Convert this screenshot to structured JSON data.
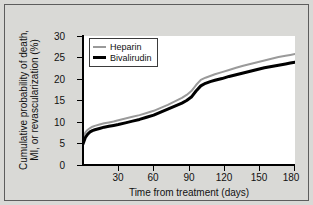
{
  "chart_data": {
    "type": "line",
    "title": "",
    "xlabel": "Time from treatment (days)",
    "ylabel": "Cumulative probability of death, MI, or revascularization (%)",
    "ylabel_line1": "Cumulative probability of death,",
    "ylabel_line2": "MI, or revascularization (%)",
    "xlim": [
      0,
      180
    ],
    "ylim": [
      0,
      30
    ],
    "xticks": [
      30,
      60,
      90,
      120,
      150,
      180
    ],
    "yticks": [
      0,
      5,
      10,
      15,
      20,
      25,
      30
    ],
    "xtick_labels": [
      "30",
      "60",
      "90",
      "120",
      "150",
      "180"
    ],
    "ytick_labels": [
      "0",
      "5",
      "10",
      "15",
      "20",
      "25",
      "30"
    ],
    "grid": false,
    "legend_position": "upper-left-inside",
    "series": [
      {
        "name": "Heparin",
        "color": "#9a9a9a",
        "line_width": 2,
        "x": [
          0,
          2,
          4,
          6,
          8,
          10,
          14,
          18,
          22,
          26,
          30,
          36,
          42,
          48,
          54,
          60,
          66,
          72,
          78,
          84,
          88,
          92,
          96,
          100,
          104,
          108,
          112,
          118,
          124,
          130,
          136,
          142,
          148,
          154,
          160,
          166,
          172,
          176,
          180
        ],
        "values": [
          6.2,
          7.6,
          8.2,
          8.6,
          8.9,
          9.1,
          9.4,
          9.7,
          9.9,
          10.1,
          10.4,
          10.8,
          11.2,
          11.6,
          12.1,
          12.6,
          13.3,
          14.0,
          14.8,
          15.6,
          16.3,
          17.2,
          18.6,
          19.8,
          20.3,
          20.7,
          21.1,
          21.6,
          22.1,
          22.6,
          23.1,
          23.5,
          23.9,
          24.3,
          24.7,
          25.1,
          25.4,
          25.6,
          25.8
        ]
      },
      {
        "name": "Bivalirudin",
        "color": "#000000",
        "line_width": 3,
        "x": [
          0,
          2,
          4,
          6,
          8,
          10,
          14,
          18,
          22,
          26,
          30,
          36,
          42,
          48,
          54,
          60,
          66,
          72,
          78,
          84,
          88,
          92,
          96,
          100,
          104,
          108,
          112,
          118,
          124,
          130,
          136,
          142,
          148,
          154,
          160,
          166,
          172,
          176,
          180
        ],
        "values": [
          4.9,
          6.4,
          7.2,
          7.7,
          8.0,
          8.2,
          8.5,
          8.8,
          9.0,
          9.2,
          9.4,
          9.8,
          10.2,
          10.6,
          11.1,
          11.6,
          12.3,
          13.0,
          13.7,
          14.4,
          15.0,
          15.8,
          17.2,
          18.4,
          19.0,
          19.4,
          19.7,
          20.1,
          20.6,
          21.0,
          21.4,
          21.8,
          22.2,
          22.6,
          22.9,
          23.2,
          23.5,
          23.7,
          23.9
        ]
      }
    ]
  },
  "legend": {
    "items": [
      {
        "label": "Heparin",
        "color": "#9a9a9a"
      },
      {
        "label": "Bivalirudin",
        "color": "#000000"
      }
    ]
  }
}
